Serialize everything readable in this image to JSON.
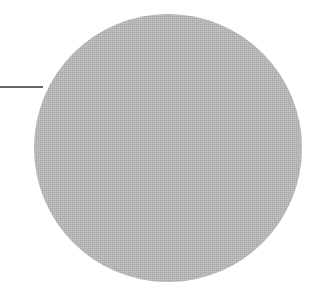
{
  "diagram": {
    "background": "#ffffff",
    "circle": {
      "cx": 168,
      "cy": 148,
      "r": 134,
      "fill": "#b4b4b4",
      "texture": "dithered-gray"
    },
    "leader_line": {
      "x1": 0,
      "y1": 87,
      "x2": 43,
      "y2": 87,
      "stroke": "#333333",
      "stroke_width": 1.5
    }
  }
}
